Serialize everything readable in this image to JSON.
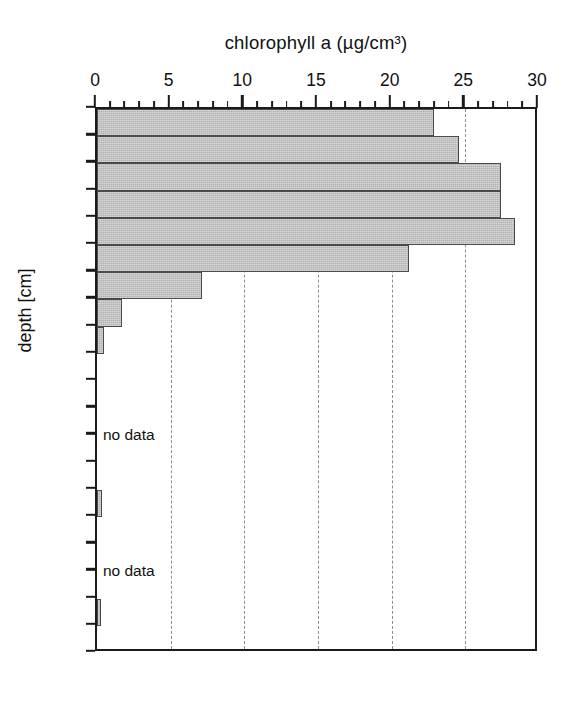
{
  "chart_data": {
    "type": "bar",
    "orientation": "horizontal-depth-profile",
    "title": "chlorophyll a (µg/cm³)",
    "xlabel": "chlorophyll a (µg/cm³)",
    "ylabel": "depth [cm]",
    "xlim": [
      0,
      30
    ],
    "ylim": [
      0,
      20
    ],
    "xticks": [
      0,
      5,
      10,
      15,
      20,
      25,
      30
    ],
    "xtick_labels": [
      "0",
      "5",
      "10",
      "15",
      "20",
      "25",
      "30"
    ],
    "xtick_minor_step": 1,
    "yticks": [
      0,
      1,
      2,
      3,
      4,
      5,
      6,
      7,
      8,
      9,
      10,
      11,
      12,
      13,
      14,
      15,
      16,
      17,
      18,
      19,
      20
    ],
    "ytick_labels": [
      "0",
      "1",
      "2",
      "3",
      "4",
      "5",
      "6",
      "7",
      "8",
      "9",
      "10",
      "11",
      "12",
      "13",
      "14",
      "15",
      "16",
      "17",
      "18",
      "19",
      "20"
    ],
    "grid": {
      "vertical_dashed_at": [
        5,
        10,
        15,
        20,
        25
      ],
      "horizontal": false
    },
    "legend": null,
    "bar_color": "#b2b2b2",
    "bar_edge_color": "#4a4a4a",
    "axis_color": "#1a1a1a",
    "bars": [
      {
        "depth_top": 0,
        "depth_bottom": 1,
        "value": 22.9
      },
      {
        "depth_top": 1,
        "depth_bottom": 2,
        "value": 24.6
      },
      {
        "depth_top": 2,
        "depth_bottom": 3,
        "value": 27.4
      },
      {
        "depth_top": 3,
        "depth_bottom": 4,
        "value": 27.4
      },
      {
        "depth_top": 4,
        "depth_bottom": 5,
        "value": 28.4
      },
      {
        "depth_top": 5,
        "depth_bottom": 6,
        "value": 21.2
      },
      {
        "depth_top": 6,
        "depth_bottom": 7,
        "value": 7.1
      },
      {
        "depth_top": 7,
        "depth_bottom": 8,
        "value": 1.7
      },
      {
        "depth_top": 8,
        "depth_bottom": 9,
        "value": 0.5
      },
      {
        "depth_top": 9,
        "depth_bottom": 10,
        "value": 0.0
      },
      {
        "depth_top": 10,
        "depth_bottom": 11,
        "value": 0.0
      },
      {
        "depth_top": 11,
        "depth_bottom": 12,
        "value": 0.0
      },
      {
        "depth_top": 12,
        "depth_bottom": 13,
        "value": 0.0
      },
      {
        "depth_top": 13,
        "depth_bottom": 14,
        "value": 0.0
      },
      {
        "depth_top": 14,
        "depth_bottom": 15,
        "value": 0.35
      },
      {
        "depth_top": 15,
        "depth_bottom": 16,
        "value": 0.0
      },
      {
        "depth_top": 16,
        "depth_bottom": 17,
        "value": 0.0
      },
      {
        "depth_top": 17,
        "depth_bottom": 18,
        "value": 0.0
      },
      {
        "depth_top": 18,
        "depth_bottom": 19,
        "value": 0.25
      },
      {
        "depth_top": 19,
        "depth_bottom": 20,
        "value": 0.0
      }
    ],
    "annotations": [
      {
        "text": "no data",
        "depth": 12,
        "x_value": 0.4
      },
      {
        "text": "no data",
        "depth": 17,
        "x_value": 0.4
      }
    ]
  }
}
